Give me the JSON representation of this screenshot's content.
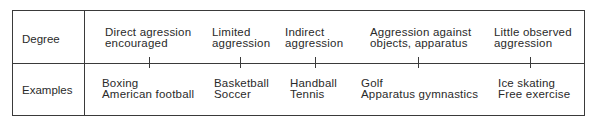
{
  "row_labels": {
    "degree": "Degree",
    "examples": "Examples"
  },
  "degrees": [
    {
      "line1": "Direct agression",
      "line2": "encouraged"
    },
    {
      "line1": "Limited",
      "line2": "aggression"
    },
    {
      "line1": "Indirect",
      "line2": "aggression"
    },
    {
      "line1": "Aggression against",
      "line2": "objects, apparatus"
    },
    {
      "line1": "Little observed",
      "line2": "aggression"
    }
  ],
  "examples": [
    {
      "line1": "Boxing",
      "line2": "American football"
    },
    {
      "line1": "Basketball",
      "line2": "Soccer"
    },
    {
      "line1": "Handball",
      "line2": "Tennis"
    },
    {
      "line1": "Golf",
      "line2": "Apparatus gymnastics"
    },
    {
      "line1": "Ice skating",
      "line2": "Free exercise"
    }
  ]
}
